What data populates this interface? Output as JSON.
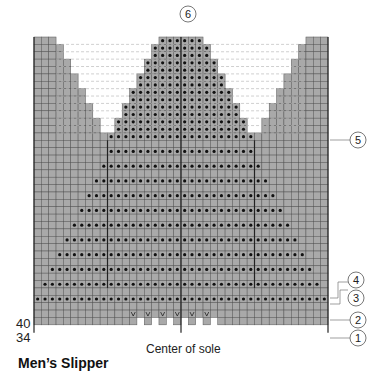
{
  "title": "Men’s Slipper",
  "center_label": "Center of sole",
  "row_labels": {
    "top": "40",
    "bottom": "34"
  },
  "callouts": [
    "1",
    "2",
    "3",
    "4",
    "5",
    "6"
  ],
  "colors": {
    "cell": "#a9a9a9",
    "grid": "#555555",
    "outline": "#222222",
    "dot": "#111111",
    "dashed": "#bbbbbb"
  },
  "grid": {
    "columns": 40,
    "rows": 39
  },
  "legend": {
    "dot": "purl stitch",
    "v": "decrease",
    "blank": "knit stitch"
  }
}
